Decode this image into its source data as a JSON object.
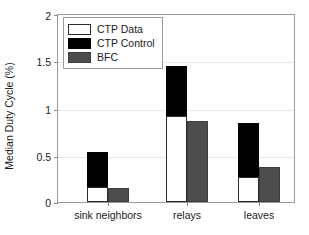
{
  "chart_data": {
    "type": "bar",
    "title": "",
    "xlabel": "",
    "ylabel": "Median Duty Cycle (%)",
    "categories": [
      "sink neighbors",
      "relays",
      "leaves"
    ],
    "ylim": [
      0,
      2
    ],
    "yticks": [
      0,
      0.5,
      1,
      1.5,
      2
    ],
    "ytick_labels": [
      "0",
      "0.5",
      "1",
      "1.5",
      "2"
    ],
    "grid": true,
    "legend_position": "upper left",
    "stacked_note": "CTP bar is stacked: CTP Data (white, bottom) + CTP Control (black, top). BFC is a separate adjacent bar.",
    "series": [
      {
        "name": "CTP Data",
        "color": "#ffffff",
        "values": [
          0.16,
          0.92,
          0.27
        ]
      },
      {
        "name": "CTP Control",
        "color": "#000000",
        "values": [
          0.53,
          1.46,
          0.84
        ]
      },
      {
        "name": "BFC",
        "color": "#4d4d4d",
        "values": [
          0.15,
          0.87,
          0.37
        ]
      }
    ]
  },
  "legend": {
    "items": [
      {
        "label": "CTP Data",
        "swatch": "legend-swatch-ctp-data"
      },
      {
        "label": "CTP Control",
        "swatch": "legend-swatch-ctp-control"
      },
      {
        "label": "BFC",
        "swatch": "legend-swatch-bfc"
      }
    ]
  },
  "axes": {
    "y_title": "Median Duty Cycle (%)",
    "y_tick_0": "0",
    "y_tick_1": "0.5",
    "y_tick_2": "1",
    "y_tick_3": "1.5",
    "y_tick_4": "2",
    "x_tick_0": "sink neighbors",
    "x_tick_1": "relays",
    "x_tick_2": "leaves"
  }
}
